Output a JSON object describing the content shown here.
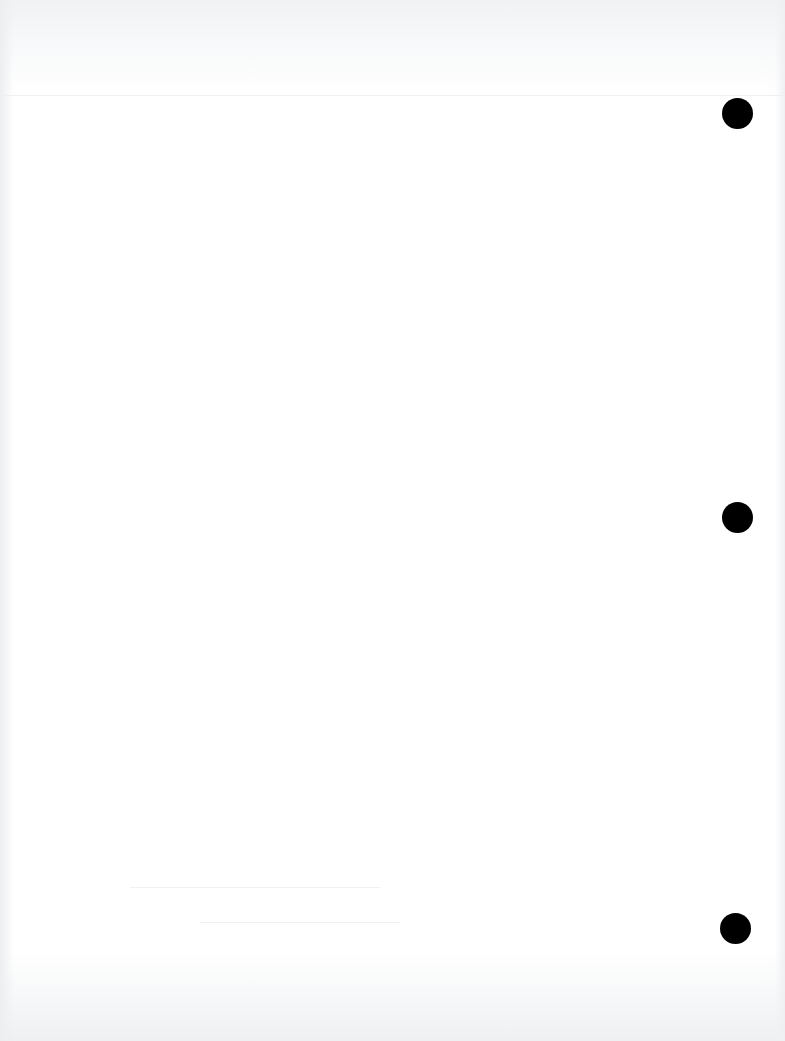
{
  "document": {
    "type": "blank scanned page",
    "text": "",
    "background_color": "#ffffff",
    "punch_holes": [
      {
        "cx": 737,
        "cy": 113,
        "r": 15,
        "color": "#000000"
      },
      {
        "cx": 737,
        "cy": 517,
        "r": 15,
        "color": "#000000"
      },
      {
        "cx": 735,
        "cy": 928,
        "r": 15,
        "color": "#000000"
      }
    ]
  }
}
